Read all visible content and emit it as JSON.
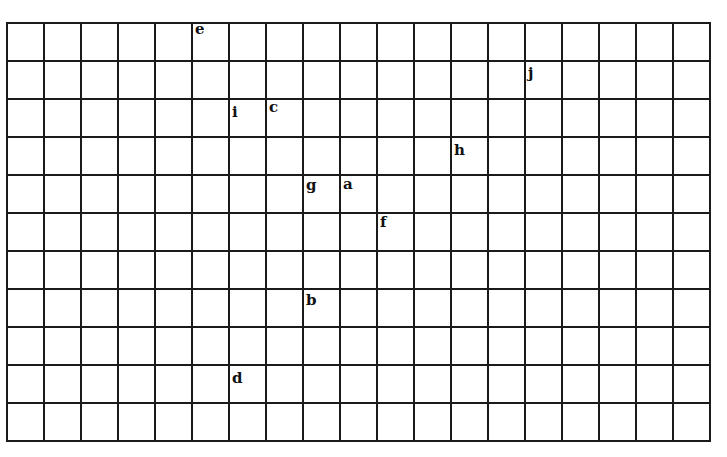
{
  "grid": {
    "columns": 19,
    "rows": 11,
    "cell_width": 37,
    "cell_height": 38,
    "line_color": "#1a1a1a"
  },
  "labels": [
    {
      "text": "e",
      "col": 5,
      "row": 0,
      "dy": 0
    },
    {
      "text": "j",
      "col": 14,
      "row": 1,
      "dy": 6
    },
    {
      "text": "i",
      "col": 6,
      "row": 2,
      "dy": 7
    },
    {
      "text": "c",
      "col": 7,
      "row": 2,
      "dy": 2
    },
    {
      "text": "h",
      "col": 12,
      "row": 3,
      "dy": 7
    },
    {
      "text": "g",
      "col": 8,
      "row": 4,
      "dy": 4
    },
    {
      "text": "a",
      "col": 9,
      "row": 4,
      "dy": 3
    },
    {
      "text": "f",
      "col": 10,
      "row": 5,
      "dy": 3
    },
    {
      "text": "b",
      "col": 8,
      "row": 7,
      "dy": 5
    },
    {
      "text": "d",
      "col": 6,
      "row": 9,
      "dy": 7
    }
  ]
}
